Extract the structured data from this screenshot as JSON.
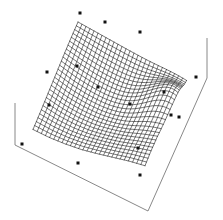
{
  "figure": {
    "title": "",
    "subtitle": "",
    "background_color": "#ffffff",
    "mesh_color": "#1d1d1d",
    "axis_color": "#6a6a6a",
    "point_color": "#111111",
    "width": 223,
    "height": 220
  },
  "chart_data": {
    "type": "scatter",
    "plot_kind": "3d-surface-wireframe-with-scatter",
    "title": "",
    "subtitle": "",
    "xlabel": "",
    "ylabel": "",
    "zlabel": "",
    "xlim": [
      0,
      1
    ],
    "ylim": [
      0,
      1
    ],
    "zlim": [
      0,
      1
    ],
    "grid": false,
    "tick_labels": {
      "x": [],
      "y": [],
      "z": []
    },
    "legend": {
      "visible": false,
      "position": "none",
      "entries": []
    },
    "annotations": [],
    "projection": {
      "kind": "axonometric",
      "base_corners_px": [
        [
          15,
          145
        ],
        [
          148,
          211
        ],
        [
          207,
          78
        ]
      ],
      "z_axis_stubs_px": [
        [
          [
            15,
            103
          ],
          [
            15,
            145
          ]
        ],
        [
          [
            207,
            38
          ],
          [
            207,
            78
          ]
        ]
      ],
      "surface_corners_px": {
        "top": [
          78,
          22
        ],
        "left": [
          33,
          112
        ],
        "bottom": [
          145,
          180
        ],
        "right": [
          186,
          95
        ]
      }
    },
    "surface": {
      "name": "fitted response surface",
      "grid_u_count": 27,
      "grid_v_count": 27,
      "description": "Smooth saddle-like response surface rendered as a wireframe mesh; mesh lines converge densely near the right-hand fold where the surface turns steeply away from the viewer.",
      "peak_region_px": [
        170,
        105
      ],
      "z_control": [
        [
          0.62,
          0.66,
          0.7,
          0.74,
          0.78,
          0.82,
          0.86,
          0.9
        ],
        [
          0.58,
          0.62,
          0.66,
          0.71,
          0.76,
          0.81,
          0.86,
          0.91
        ],
        [
          0.53,
          0.57,
          0.62,
          0.68,
          0.74,
          0.8,
          0.86,
          0.92
        ],
        [
          0.47,
          0.51,
          0.57,
          0.64,
          0.72,
          0.79,
          0.87,
          0.94
        ],
        [
          0.41,
          0.45,
          0.52,
          0.6,
          0.69,
          0.78,
          0.88,
          0.97
        ],
        [
          0.35,
          0.39,
          0.46,
          0.55,
          0.66,
          0.77,
          0.89,
          1.0
        ],
        [
          0.29,
          0.33,
          0.4,
          0.5,
          0.62,
          0.74,
          0.87,
          0.98
        ],
        [
          0.24,
          0.28,
          0.35,
          0.44,
          0.56,
          0.69,
          0.82,
          0.93
        ]
      ]
    },
    "points": {
      "name": "observed data",
      "marker": "square",
      "marker_size_px": 3,
      "count": 14,
      "screen_px": [
        [
          80,
          13
        ],
        [
          105,
          22
        ],
        [
          140,
          32
        ],
        [
          47,
          72
        ],
        [
          77,
          66
        ],
        [
          98,
          87
        ],
        [
          130,
          104
        ],
        [
          164,
          92
        ],
        [
          196,
          77
        ],
        [
          171,
          115
        ],
        [
          179,
          117
        ],
        [
          22,
          144
        ],
        [
          49,
          105
        ],
        [
          78,
          163
        ],
        [
          138,
          148
        ],
        [
          140,
          175
        ]
      ]
    }
  }
}
